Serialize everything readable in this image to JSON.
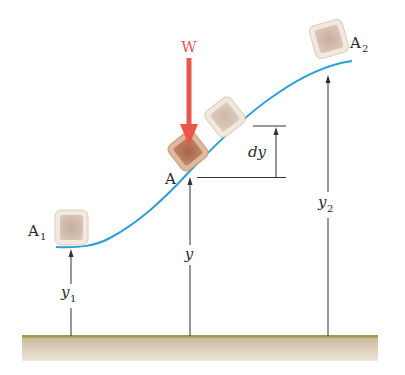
{
  "diagram": {
    "title": "",
    "colors": {
      "curve": "#2a9fd6",
      "force": "#e8584a",
      "line": "#333333",
      "ground_top": "#8aa040",
      "ground_fill": "#d9cdb8",
      "block_light": "#e9ddd0",
      "block_inner": "#c9b2a1",
      "block_dark": "#a46a4b"
    },
    "labels": {
      "force": "W",
      "point_start": "A",
      "point_start_sub": "1",
      "point_mid": "A",
      "point_end": "A",
      "point_end_sub": "2",
      "height_start": "y",
      "height_start_sub": "1",
      "height_mid": "y",
      "height_end": "y",
      "height_end_sub": "2",
      "increment": "dy"
    }
  }
}
